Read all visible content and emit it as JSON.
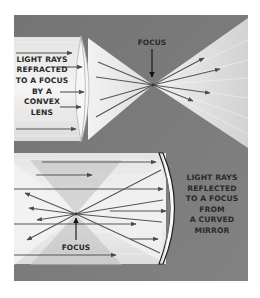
{
  "diagram": {
    "colors": {
      "background": "#ffffff",
      "panel": "#7c7c7c",
      "panel_dark": "#6a6a6a",
      "light": "#ececec",
      "light_shade": "#d8d8d8",
      "ray": "#555555",
      "lens_edge": "#b8b8b8",
      "mirror_edge": "#1e1e1e",
      "text": "#2a2a2a"
    },
    "top_panel": {
      "name": "convex-lens-panel",
      "caption_lines": [
        "LIGHT RAYS",
        "REFRACTED",
        "TO A FOCUS",
        "BY A",
        "CONVEX",
        "LENS"
      ],
      "focus_label": "FOCUS",
      "focus_point": {
        "x": 153,
        "y": 85
      },
      "optical_element": "convex lens"
    },
    "bottom_panel": {
      "name": "curved-mirror-panel",
      "caption_lines": [
        "LIGHT RAYS",
        "REFLECTED",
        "TO A FOCUS",
        "FROM",
        "A CURVED",
        "MIRROR"
      ],
      "focus_label": "FOCUS",
      "focus_point": {
        "x": 76,
        "y": 214
      },
      "optical_element": "curved mirror"
    }
  }
}
